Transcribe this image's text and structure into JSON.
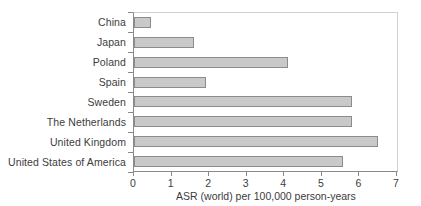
{
  "chart_data": {
    "type": "bar",
    "orientation": "horizontal",
    "title": "",
    "subtitle": "",
    "xlabel": "ASR (world) per 100,000 person-years",
    "ylabel": "",
    "xlim": [
      0,
      7
    ],
    "xticks": [
      "0",
      "1",
      "2",
      "3",
      "4",
      "5",
      "6",
      "7"
    ],
    "grid": false,
    "legend": null,
    "categories": [
      "China",
      "Japan",
      "Poland",
      "Spain",
      "Sweden",
      "The Netherlands",
      "United Kingdom",
      "United States of America"
    ],
    "values": [
      0.45,
      1.6,
      4.1,
      1.92,
      5.8,
      5.8,
      6.5,
      5.55
    ],
    "series": [
      {
        "name": "ASR (world) per 100,000 person-years",
        "values": [
          0.45,
          1.6,
          4.1,
          1.92,
          5.8,
          5.8,
          6.5,
          5.55
        ]
      }
    ]
  },
  "style": {
    "bar_fill": "#c9c9c9",
    "bar_border": "#8c8c8c",
    "axis_color": "#8a8a8a",
    "frame_color": "#d0d0d0",
    "text_color": "#3c3c3c",
    "background": "#ffffff"
  }
}
